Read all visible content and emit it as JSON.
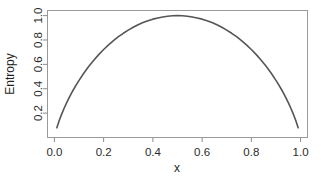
{
  "chart_data": {
    "type": "line",
    "title": "",
    "xlabel": "x",
    "ylabel": "Entropy",
    "xlim": [
      -0.028,
      1.028
    ],
    "ylim": [
      0.0,
      1.042
    ],
    "xticks": [
      0.0,
      0.2,
      0.4,
      0.6,
      0.8,
      1.0
    ],
    "xticklabels": [
      "0.0",
      "0.2",
      "0.4",
      "0.6",
      "0.8",
      "1.0"
    ],
    "yticks": [
      0.2,
      0.4,
      0.6,
      0.8,
      1.0
    ],
    "yticklabels": [
      "0.2",
      "0.4",
      "0.6",
      "0.8",
      "1.0"
    ],
    "grid": false,
    "legend": null,
    "series": [
      {
        "name": "Binary entropy",
        "color": "#555555",
        "linewidth": 1.6,
        "x": [
          0.01,
          0.02,
          0.03,
          0.04,
          0.05,
          0.06,
          0.07,
          0.08,
          0.09,
          0.1,
          0.12,
          0.14,
          0.16,
          0.18,
          0.2,
          0.22,
          0.24,
          0.26,
          0.28,
          0.3,
          0.32,
          0.34,
          0.36,
          0.38,
          0.4,
          0.42,
          0.44,
          0.46,
          0.48,
          0.5,
          0.52,
          0.54,
          0.56,
          0.58,
          0.6,
          0.62,
          0.64,
          0.66,
          0.68,
          0.7,
          0.72,
          0.74,
          0.76,
          0.78,
          0.8,
          0.82,
          0.84,
          0.86,
          0.88,
          0.9,
          0.91,
          0.92,
          0.93,
          0.94,
          0.95,
          0.96,
          0.97,
          0.98,
          0.99
        ],
        "y": [
          0.081,
          0.141,
          0.194,
          0.242,
          0.286,
          0.327,
          0.366,
          0.402,
          0.436,
          0.469,
          0.529,
          0.584,
          0.634,
          0.68,
          0.722,
          0.76,
          0.795,
          0.827,
          0.855,
          0.881,
          0.904,
          0.925,
          0.943,
          0.958,
          0.971,
          0.981,
          0.989,
          0.995,
          0.999,
          1.0,
          0.999,
          0.995,
          0.989,
          0.981,
          0.971,
          0.958,
          0.943,
          0.925,
          0.904,
          0.881,
          0.855,
          0.827,
          0.795,
          0.76,
          0.722,
          0.68,
          0.634,
          0.584,
          0.529,
          0.469,
          0.436,
          0.402,
          0.366,
          0.327,
          0.286,
          0.242,
          0.194,
          0.141,
          0.081
        ]
      }
    ]
  },
  "axes": {
    "frame_color": "#9a9a9a",
    "tick_color": "#8c8c8c",
    "text_color": "#2b2b2b",
    "background": "#ffffff"
  }
}
